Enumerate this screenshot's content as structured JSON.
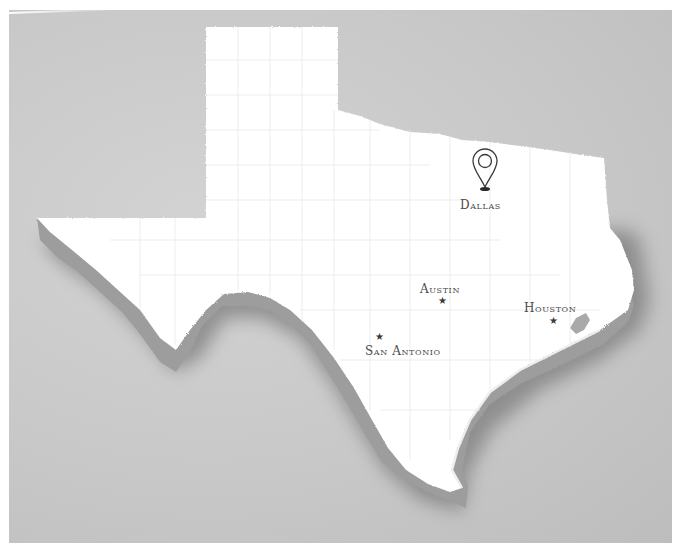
{
  "map": {
    "region": "Texas",
    "style": "3D extruded white state on gray background",
    "colors": {
      "background": "#c9c9c9",
      "frame": "#ffffff",
      "land": "#ffffff",
      "extrusion": "#9a9a9a",
      "shadow": "#8a8a8a",
      "county_lines": "#e6e6e6",
      "label": "#4a4a4a"
    }
  },
  "markers": [
    {
      "name": "Dallas",
      "icon": "map-pin-icon",
      "label": "Dallas"
    },
    {
      "name": "Austin",
      "icon": "star-icon",
      "label": "Austin"
    },
    {
      "name": "Houston",
      "icon": "star-icon",
      "label": "Houston"
    },
    {
      "name": "San Antonio",
      "icon": "star-icon",
      "label": "San Antonio"
    }
  ],
  "icons": {
    "star": "★"
  }
}
